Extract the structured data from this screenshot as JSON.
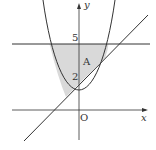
{
  "diagram": {
    "labels": {
      "y_axis": "y",
      "x_axis": "x",
      "origin": "O",
      "tick_5": "5",
      "tick_2": "2",
      "region": "A"
    },
    "curves": {
      "parabola": "y = x^2",
      "line": "y = x + 2",
      "horizontal_line": "y = 5"
    },
    "colors": {
      "stroke": "#333333",
      "shade": "#d9d9d9",
      "background": "#ffffff"
    }
  }
}
